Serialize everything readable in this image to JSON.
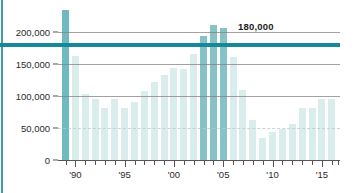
{
  "chart_data": {
    "type": "bar",
    "title": "",
    "subtitle": "",
    "xlabel": "",
    "ylabel": "",
    "ylim": [
      0,
      250000
    ],
    "grid": true,
    "legend_position": "none",
    "y_ticks": [
      {
        "value": 0,
        "label": "0"
      },
      {
        "value": 50000,
        "label": "50,000"
      },
      {
        "value": 100000,
        "label": "100,000"
      },
      {
        "value": 150000,
        "label": "150,000"
      },
      {
        "value": 200000,
        "label": "200,000"
      }
    ],
    "x_tick_labels": [
      {
        "category": "'90",
        "label": "'90"
      },
      {
        "category": "'95",
        "label": "'95"
      },
      {
        "category": "'00",
        "label": "'00"
      },
      {
        "category": "'05",
        "label": "'05"
      },
      {
        "category": "'10",
        "label": "'10"
      },
      {
        "category": "'15",
        "label": "'15"
      }
    ],
    "annotations": [
      {
        "name": "threshold-line",
        "label": "180,000",
        "value": 180000,
        "color": "#13899a"
      }
    ],
    "categories": [
      "1989",
      "1990",
      "1991",
      "1992",
      "1993",
      "1994",
      "1995",
      "1996",
      "1997",
      "1998",
      "1999",
      "2000",
      "2001",
      "2002",
      "2003",
      "2004",
      "2005",
      "2006",
      "2007",
      "2008",
      "2009",
      "2010",
      "2011",
      "2012",
      "2013",
      "2014",
      "2015",
      "2016"
    ],
    "values": [
      235000,
      163000,
      103000,
      95000,
      81000,
      95000,
      82000,
      91000,
      108000,
      122000,
      133000,
      143000,
      142000,
      166000,
      193000,
      211000,
      206000,
      161000,
      110000,
      62000,
      34000,
      43000,
      48000,
      56000,
      81000,
      82000,
      96000,
      96000
    ],
    "highlighted": [
      "1989",
      "2003",
      "2004",
      "2005"
    ],
    "colors": {
      "bar": "#d9eeec",
      "bar_highlight": "#86c2c6",
      "bar_first": "#6fb9c0",
      "threshold": "#13899a",
      "gridline": "#8a7f82",
      "axis": "#5d5255",
      "text": "#2b2b2b",
      "background": "#ffffff",
      "left_rule": "#3f9fa6"
    }
  }
}
